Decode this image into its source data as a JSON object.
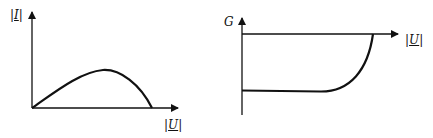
{
  "left_plot": {
    "y_label": {
      "bar_open": "|",
      "symbol": "I",
      "bar_close": "|"
    },
    "x_label": {
      "bar_open": "|",
      "symbol": "U",
      "bar_close": "|"
    },
    "curve_description": "rises from origin to a maximum, then falls back to zero"
  },
  "right_plot": {
    "y_label": "G",
    "x_label": {
      "bar_open": "|",
      "symbol": "U",
      "bar_close": "|"
    },
    "curve_description": "constant negative value, then rises steeply to zero"
  },
  "colors": {
    "line": "#111111",
    "background": "#ffffff"
  }
}
